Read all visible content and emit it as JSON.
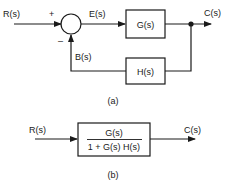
{
  "diagram_a": {
    "input_label": "R(s)",
    "plus_sign": "+",
    "minus_sign": "–",
    "error_label": "E(s)",
    "forward_block": "G(s)",
    "output_label": "C(s)",
    "feedback_label": "B(s)",
    "feedback_block": "H(s)",
    "caption": "(a)"
  },
  "diagram_b": {
    "input_label": "R(s)",
    "numerator": "G(s)",
    "denominator": "1 + G(s) H(s)",
    "output_label": "C(s)",
    "caption": "(b)"
  },
  "colors": {
    "line": "#1a1a1a",
    "background": "#ffffff"
  }
}
